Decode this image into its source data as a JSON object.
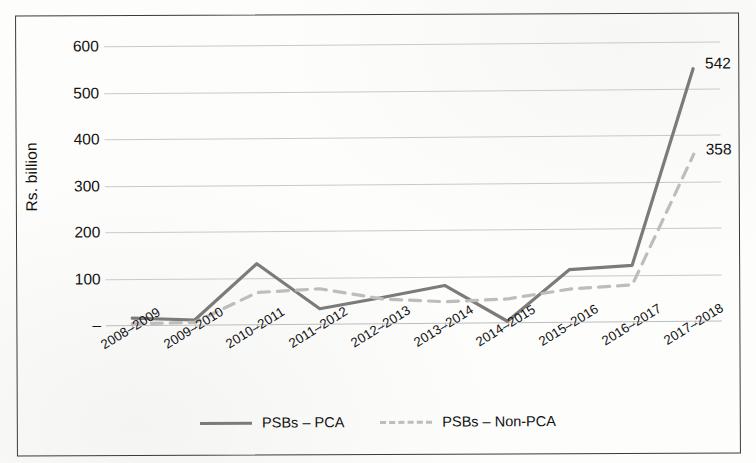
{
  "chart_data": {
    "type": "line",
    "title": "",
    "xlabel": "",
    "ylabel": "Rs. billion",
    "ylim": [
      0,
      600
    ],
    "ytick_labels": [
      "600",
      "500",
      "400",
      "300",
      "200",
      "100",
      "–"
    ],
    "ytick_values": [
      600,
      500,
      400,
      300,
      200,
      100,
      0
    ],
    "grid": true,
    "legend_position": "bottom",
    "categories": [
      "2008–2009",
      "2009–2010",
      "2010–2011",
      "2011–2012",
      "2012–2013",
      "2013–2014",
      "2014–2015",
      "2015–2016",
      "2016–2017",
      "2017–2018"
    ],
    "series": [
      {
        "name": "PSBs – PCA",
        "style": "solid",
        "color": "#7b7b7b",
        "values": [
          15,
          10,
          130,
          32,
          55,
          80,
          2,
          112,
          120,
          542
        ]
      },
      {
        "name": "PSBs – Non-PCA",
        "style": "dashed",
        "color": "#bdbdbd",
        "values": [
          3,
          5,
          68,
          75,
          52,
          45,
          50,
          70,
          78,
          358
        ]
      }
    ],
    "annotations": [
      {
        "text": "542",
        "series": "PSBs – PCA",
        "category": "2017–2018",
        "value": 542
      },
      {
        "text": "358",
        "series": "PSBs – Non-PCA",
        "category": "2017–2018",
        "value": 358
      }
    ]
  },
  "legend": {
    "items": [
      {
        "label": "PSBs – PCA",
        "style": "solid"
      },
      {
        "label": "PSBs – Non-PCA",
        "style": "dashed"
      }
    ]
  },
  "axes": {
    "y_title": "Rs. billion"
  }
}
